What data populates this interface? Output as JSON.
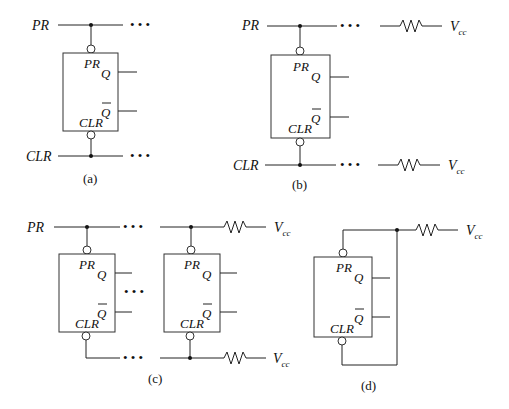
{
  "figure": {
    "panels": [
      {
        "id": "a",
        "caption": "(a)",
        "signals": {
          "top": "PR",
          "bottom": "CLR"
        },
        "ellipsis": "• • •"
      },
      {
        "id": "b",
        "caption": "(b)",
        "signals": {
          "top": "PR",
          "bottom": "CLR"
        },
        "ellipsis": "• • •",
        "supply": "V",
        "supply_sub": "cc"
      },
      {
        "id": "c",
        "caption": "(c)",
        "signals": {
          "top": "PR"
        },
        "ellipsis": "• • •",
        "supply": "V",
        "supply_sub": "cc"
      },
      {
        "id": "d",
        "caption": "(d)",
        "supply": "V",
        "supply_sub": "cc"
      }
    ],
    "flipflop": {
      "pin_pr": "PR",
      "pin_clr": "CLR",
      "out_q": "Q",
      "out_qbar": "Q"
    }
  }
}
